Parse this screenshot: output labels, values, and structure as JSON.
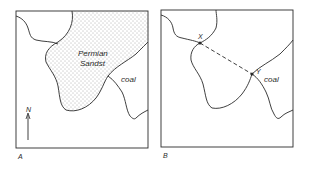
{
  "figure": {
    "panels": [
      {
        "id": "A",
        "label": "A",
        "unit_label": "Permian",
        "unit_label_2": "Sandst",
        "coal_label": "coal",
        "north_label": "N"
      },
      {
        "id": "B",
        "label": "B",
        "coal_label": "coal",
        "point_x_label": "X",
        "point_y_label": "Y"
      }
    ]
  },
  "colors": {
    "line": "#2a2a2a",
    "stipple": "#555555",
    "background": "#ffffff"
  }
}
